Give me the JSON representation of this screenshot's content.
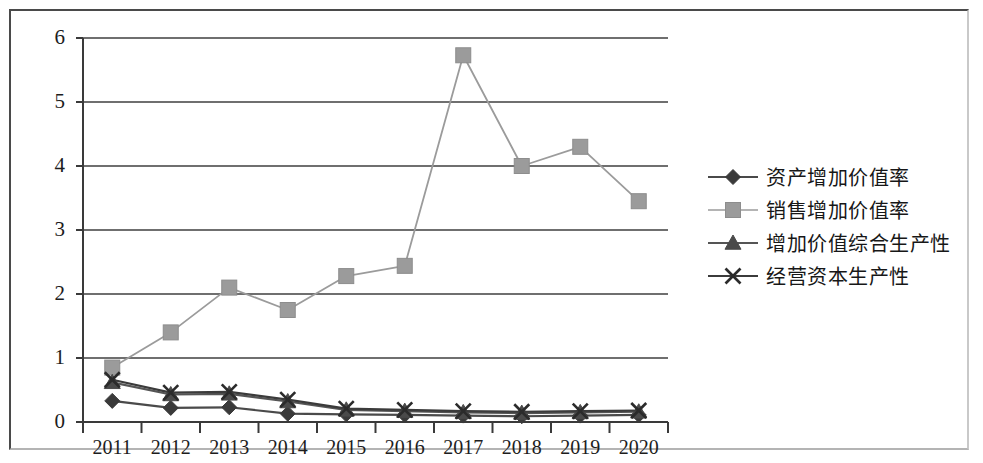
{
  "chart_data": {
    "type": "line",
    "title": "",
    "subtitle": "",
    "xlabel": "",
    "ylabel": "",
    "categories": [
      "2011",
      "2012",
      "2013",
      "2014",
      "2015",
      "2016",
      "2017",
      "2018",
      "2019",
      "2020"
    ],
    "ylim": [
      0,
      6
    ],
    "yticks": [
      0,
      1,
      2,
      3,
      4,
      5,
      6
    ],
    "ytick_labels": [
      "0",
      "1",
      "2",
      "3",
      "4",
      "5",
      "6"
    ],
    "grid": true,
    "grid_axis": "y",
    "legend_position": "right",
    "series": [
      {
        "name": "资产增加价值率",
        "marker": "diamond",
        "color": "#3a3a3a",
        "line_color": "#4a4a4a",
        "values": [
          0.33,
          0.22,
          0.23,
          0.13,
          0.12,
          0.11,
          0.1,
          0.09,
          0.1,
          0.11
        ]
      },
      {
        "name": "销售增加价值率",
        "marker": "square",
        "color": "#9b9b9b",
        "line_color": "#9b9b9b",
        "values": [
          0.85,
          1.4,
          2.1,
          1.75,
          2.28,
          2.44,
          5.73,
          4.0,
          4.3,
          3.45
        ]
      },
      {
        "name": "增加价值综合生产性",
        "marker": "triangle",
        "color": "#4a4a4a",
        "line_color": "#555555",
        "values": [
          0.62,
          0.43,
          0.44,
          0.32,
          0.19,
          0.17,
          0.15,
          0.14,
          0.15,
          0.16
        ]
      },
      {
        "name": "经营资本生产性",
        "marker": "x",
        "color": "#2b2b2b",
        "line_color": "#3b3b3b",
        "values": [
          0.66,
          0.46,
          0.47,
          0.35,
          0.21,
          0.19,
          0.17,
          0.16,
          0.17,
          0.18
        ]
      }
    ]
  },
  "axes": {
    "y_tick_labels": [
      "6",
      "5",
      "4",
      "3",
      "2",
      "1",
      "0"
    ],
    "x_tick_labels": [
      "2011",
      "2012",
      "2013",
      "2014",
      "2015",
      "2016",
      "2017",
      "2018",
      "2019",
      "2020"
    ]
  },
  "legend": {
    "items": [
      {
        "label": "资产增加价值率",
        "marker": "diamond-marker-icon"
      },
      {
        "label": "销售增加价值率",
        "marker": "square-marker-icon"
      },
      {
        "label": "增加价值综合生产性",
        "marker": "triangle-marker-icon"
      },
      {
        "label": "经营资本生产性",
        "marker": "x-marker-icon"
      }
    ]
  },
  "colors": {
    "axis": "#3a3a3a",
    "grid": "#3f3f3f",
    "series_gray": "#9b9b9b",
    "series_dark": "#3a3a3a",
    "text": "#1d1d1d",
    "frame": "#4a4a4a"
  }
}
